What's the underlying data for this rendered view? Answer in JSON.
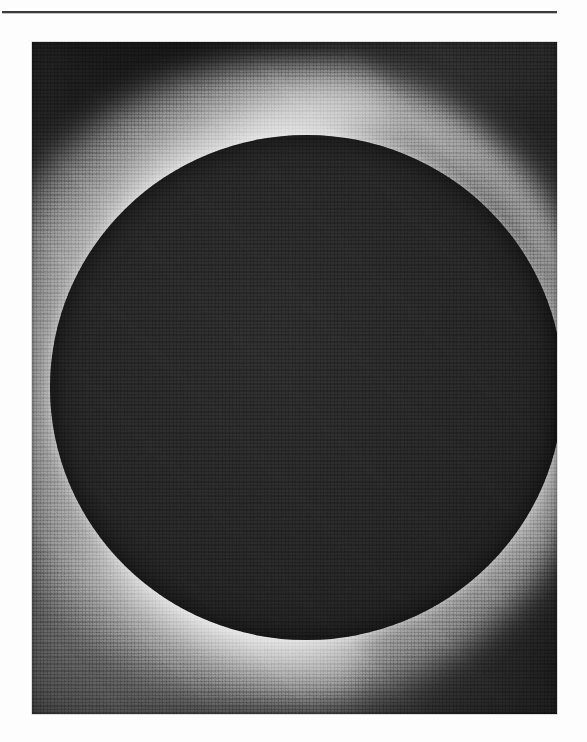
{
  "page": {
    "kind": "scanned-book-plate",
    "background_color": "#fdfdfd",
    "width_px": 587,
    "height_px": 742
  },
  "rule": {
    "name": "header-rule",
    "color": "#1c1c1c",
    "left_px": 2,
    "top_px": 11,
    "width_px": 555,
    "thickness_px": 2
  },
  "plate": {
    "title": "",
    "caption": "",
    "alt": "Total solar eclipse: the black lunar disk surrounded by the bright white corona",
    "left_px": 32,
    "top_px": 42,
    "width_px": 525,
    "height_px": 672,
    "subject": "total-solar-eclipse",
    "rendering": "halftone-grayscale-print",
    "colors": {
      "moon_disk": "#232323",
      "corona_bright": "#ffffff",
      "sky_dark": "#2b2b2b",
      "sky_mid": "#6b6b6b",
      "border": "#5a5a5a"
    },
    "geometry": {
      "disk_center_x_px": 275,
      "disk_center_y_px": 345,
      "disk_diameter_px": 505,
      "corona_extent_px": 640
    },
    "features": [
      {
        "name": "corona-streamer-upper-left",
        "brightness": "very-bright",
        "angle_deg": -26
      },
      {
        "name": "corona-streamer-lower-left",
        "brightness": "very-bright",
        "angle_deg": 22
      },
      {
        "name": "corona-glow-upper-right",
        "brightness": "bright",
        "angle_deg": 0
      },
      {
        "name": "sky-dark-corner-top-left",
        "brightness": "dark",
        "angle_deg": 0
      },
      {
        "name": "sky-dark-corner-top-right",
        "brightness": "dark",
        "angle_deg": 0
      },
      {
        "name": "sky-dark-corner-bottom-right",
        "brightness": "dark",
        "angle_deg": 0
      }
    ]
  }
}
